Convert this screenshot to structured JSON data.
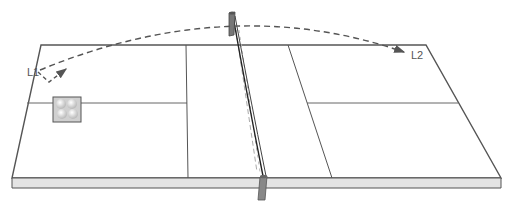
{
  "diagram": {
    "labels": {
      "start": "L1",
      "end": "L2"
    },
    "colors": {
      "outline": "#555555",
      "edge_fill": "#e4e4e4",
      "dashed_path": "#555555",
      "net_post": "#777777",
      "tray_fill": "#d0d0d0",
      "ball": "#f4f4f4"
    },
    "elements": [
      {
        "name": "table-top",
        "description": "Perspective table surface"
      },
      {
        "name": "table-edge",
        "description": "Front thickness band"
      },
      {
        "name": "net",
        "description": "Net across center with two posts"
      },
      {
        "name": "ball-tray",
        "description": "Box holding four balls on left court"
      },
      {
        "name": "trajectory",
        "description": "Dashed arc from L1 over net to L2"
      }
    ]
  }
}
